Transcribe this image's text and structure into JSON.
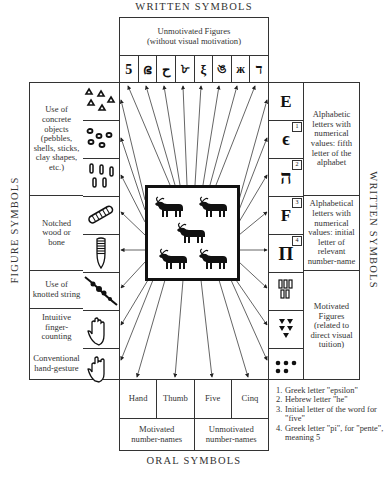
{
  "captions": {
    "top": "WRITTEN SYMBOLS",
    "bottom": "ORAL SYMBOLS",
    "left": "FIGURE SYMBOLS",
    "right": "WRITTEN SYMBOLS"
  },
  "top_box": {
    "title_line1": "Unmotivated Figures",
    "title_line2": "(without visual motivation)",
    "glyphs": [
      "5",
      "ഭ",
      "ح",
      "৮",
      "ξ",
      "ঙ",
      "ж",
      "ד"
    ]
  },
  "left_groups": [
    {
      "label": "Use of concrete objects (pebbles, shells, sticks, clay shapes, etc.)",
      "icons": [
        "pebbles-icon",
        "shells-icon",
        "sticks-icon"
      ]
    },
    {
      "label": "Notched wood or bone",
      "icons": [
        "notched-wood-icon",
        "notched-bone-icon"
      ]
    },
    {
      "label": "Use of knotted string",
      "icons": [
        "knotted-string-icon"
      ]
    },
    {
      "label_a": "Intuitive finger-counting",
      "label_b": "Conventional hand-gesture",
      "icons": [
        "open-hand-icon",
        "hand-gesture-icon"
      ]
    }
  ],
  "right_groups": [
    {
      "label": "Alphabetic letters with numerical values: fifth letter of the alphabet",
      "glyphs": [
        {
          "char": "E",
          "note": ""
        },
        {
          "char": "ϵ",
          "note": "1"
        },
        {
          "char": "ה",
          "note": "2"
        }
      ]
    },
    {
      "label": "Alphabetical letters with numerical values: initial letter of relevant number-name",
      "glyphs": [
        {
          "char": "F",
          "note": "3"
        },
        {
          "char": "Π",
          "note": "4"
        }
      ]
    },
    {
      "label": "Motivated Figures (related to direct visual tuition)",
      "icons": [
        "tally-strokes-icon",
        "cuneiform-marks-icon",
        "dots-icon"
      ]
    }
  ],
  "bottom_box": {
    "words": [
      "Hand",
      "Thumb",
      "Five",
      "Cinq"
    ],
    "groups": [
      "Motivated number-names",
      "Unmotivated number-names"
    ]
  },
  "center": {
    "icon": "five-oxen-icon",
    "count": 5
  },
  "footnotes": [
    {
      "num": "1.",
      "text": "Greek letter \"epsilon\""
    },
    {
      "num": "2.",
      "text": "Hebrew letter \"he\""
    },
    {
      "num": "3.",
      "text": "Initial letter of the word for \"five\""
    },
    {
      "num": "4.",
      "text": "Greek letter \"pi\", for \"pente\", meaning 5"
    }
  ]
}
